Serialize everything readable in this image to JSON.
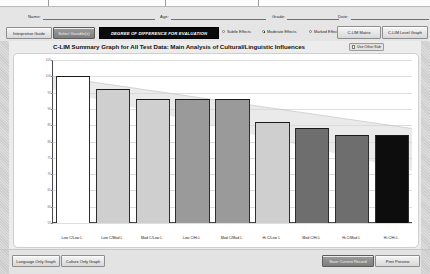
{
  "window": {
    "fields": [
      {
        "label": "Name:",
        "value": "",
        "x": 28,
        "w": 112
      },
      {
        "label": "Age:",
        "value": "",
        "x": 160,
        "w": 95
      },
      {
        "label": "Grade:",
        "value": "",
        "x": 272,
        "w": 52
      },
      {
        "label": "Date:",
        "value": "",
        "x": 338,
        "w": 78
      }
    ]
  },
  "toolbar": {
    "interpretive_guide": "Interpretive Guide",
    "select_variables": "Select Variable(s)",
    "banner": "DEGREE OF DIFFERENCE FOR EVALUATION",
    "radios": [
      {
        "label": "Subtle Effects",
        "selected": false
      },
      {
        "label": "Moderate Effects",
        "selected": true
      },
      {
        "label": "Marked Effects",
        "selected": false
      }
    ],
    "clim_matrix": "C-LIM Matrix",
    "clim_level_graph": "C-LIM Level Graph"
  },
  "chart_panel": {
    "title": "C-LIM Summary Graph for All Test Data: Main Analysis of Cultural/Linguistic Influences",
    "checkbox": {
      "label": "Use Other Sub",
      "checked": false
    }
  },
  "footer": {
    "language_only_graph": "Language Only Graph",
    "culture_only_graph": "Culture Only Graph",
    "save_current_record": "Save Current Record",
    "print_preview": "Print Preview"
  },
  "chart_data": {
    "type": "bar",
    "title": "C-LIM Summary Graph for All Test Data: Main Analysis of Cultural/Linguistic Influences",
    "xlabel": "",
    "ylabel": "",
    "ylim": [
      55,
      105
    ],
    "yticks": [
      105,
      100,
      95,
      90,
      85,
      80,
      75,
      70,
      65,
      60,
      55
    ],
    "grid": true,
    "categories": [
      "Low C/Low L",
      "Low C/Mod L",
      "Mod C/Low L",
      "Low C/Hi L",
      "Mod C/Mod L",
      "Hi C/Low L",
      "Mod C/Hi L",
      "Hi C/Mod L",
      "Hi C/Hi L"
    ],
    "values": [
      100,
      96,
      93,
      93,
      93,
      86,
      84,
      82,
      82
    ],
    "value_labels": [
      "",
      "",
      "",
      "",
      "",
      "",
      "",
      "",
      ""
    ],
    "bar_shades": [
      "#ffffff",
      "#cfcfcf",
      "#cfcfcf",
      "#9a9a9a",
      "#9a9a9a",
      "#cfcfcf",
      "#6e6e6e",
      "#6e6e6e",
      "#0d0d0d"
    ],
    "expected_range": {
      "note": "declining shaded band of expected performance",
      "top_start": 100,
      "top_end": 84,
      "bottom_start": 96,
      "bottom_end": 71
    }
  }
}
